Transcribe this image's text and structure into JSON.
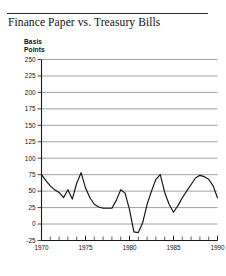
{
  "figure": {
    "title": "Finance Paper vs. Treasury Bills",
    "axis_unit_line1": "Basis",
    "axis_unit_line2": "Points"
  },
  "chart_data": {
    "type": "line",
    "title": "Finance Paper vs. Treasury Bills",
    "xlabel": "",
    "ylabel": "Basis Points",
    "ylim": [
      -25,
      250
    ],
    "xlim": [
      1970,
      1990
    ],
    "grid": true,
    "legend": "none",
    "yticks": [
      -25,
      0,
      25,
      50,
      75,
      100,
      125,
      150,
      175,
      200,
      225,
      250
    ],
    "ytick_labels": [
      "-25",
      "0",
      "25",
      "50",
      "75",
      "100",
      "125",
      "150",
      "175",
      "200",
      "225",
      "250"
    ],
    "xticks": [
      1970,
      1975,
      1980,
      1985,
      1990
    ],
    "xtick_labels": [
      "1970",
      "1975",
      "1980",
      "1985",
      "1990"
    ],
    "xminor_ticks": [
      1970,
      1971,
      1972,
      1973,
      1974,
      1975,
      1976,
      1977,
      1978,
      1979,
      1980,
      1981,
      1982,
      1983,
      1984,
      1985,
      1986,
      1987,
      1988,
      1989,
      1990
    ],
    "line_color": "#111111",
    "grid_color": "#8a8a8a",
    "series": [
      {
        "name": "Finance Paper vs. Treasury Bills spread",
        "x": [
          1970,
          1970.5,
          1971,
          1971.5,
          1972,
          1972.5,
          1973,
          1973.5,
          1974,
          1974.5,
          1975,
          1975.5,
          1976,
          1976.5,
          1977,
          1977.5,
          1978,
          1978.5,
          1979,
          1979.5,
          1980,
          1980.5,
          1981,
          1981.5,
          1982,
          1982.5,
          1983,
          1983.5,
          1984,
          1984.5,
          1985,
          1985.5,
          1986,
          1986.5,
          1987,
          1987.5,
          1988,
          1988.5,
          1989,
          1989.5,
          1990
        ],
        "values": [
          75,
          66,
          58,
          52,
          48,
          40,
          52,
          38,
          62,
          78,
          55,
          40,
          30,
          26,
          24,
          24,
          24,
          36,
          52,
          47,
          22,
          -12,
          -13,
          2,
          30,
          50,
          68,
          75,
          48,
          30,
          18,
          28,
          40,
          50,
          60,
          70,
          74,
          72,
          68,
          58,
          40
        ]
      }
    ]
  }
}
